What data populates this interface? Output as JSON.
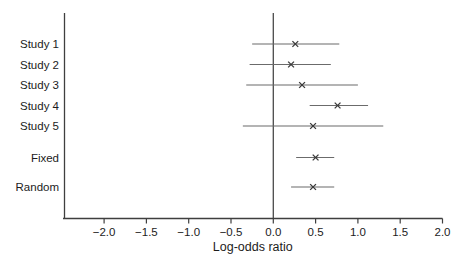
{
  "figure": {
    "title": "",
    "xlabel": "Log-odds ratio"
  },
  "chart_data": {
    "type": "scatter",
    "subtype": "forest-plot",
    "title": "",
    "xlabel": "Log-odds ratio",
    "ylabel": "",
    "xlim": [
      -2.47,
      2.0
    ],
    "grid": false,
    "legend": "none",
    "reference_line_x": 0.0,
    "marker_symbol": "x",
    "x_ticks": [
      {
        "value": -2.0,
        "label": "−2.0"
      },
      {
        "value": -1.5,
        "label": "−1.5"
      },
      {
        "value": -1.0,
        "label": "−1.0"
      },
      {
        "value": -0.5,
        "label": "−0.5"
      },
      {
        "value": 0.0,
        "label": "0.0"
      },
      {
        "value": 0.5,
        "label": "0.5"
      },
      {
        "value": 1.0,
        "label": "1.0"
      },
      {
        "value": 1.5,
        "label": "1.5"
      },
      {
        "value": 2.0,
        "label": "2.0"
      }
    ],
    "rows": [
      {
        "label": "Study 1",
        "group": "study",
        "estimate": 0.26,
        "ci_lower": -0.25,
        "ci_upper": 0.78
      },
      {
        "label": "Study 2",
        "group": "study",
        "estimate": 0.21,
        "ci_lower": -0.28,
        "ci_upper": 0.68
      },
      {
        "label": "Study 3",
        "group": "study",
        "estimate": 0.34,
        "ci_lower": -0.32,
        "ci_upper": 1.0
      },
      {
        "label": "Study 4",
        "group": "study",
        "estimate": 0.76,
        "ci_lower": 0.43,
        "ci_upper": 1.12
      },
      {
        "label": "Study 5",
        "group": "study",
        "estimate": 0.47,
        "ci_lower": -0.36,
        "ci_upper": 1.3
      },
      {
        "label": "Fixed",
        "group": "summary",
        "estimate": 0.5,
        "ci_lower": 0.27,
        "ci_upper": 0.72
      },
      {
        "label": "Random",
        "group": "summary",
        "estimate": 0.47,
        "ci_lower": 0.21,
        "ci_upper": 0.72
      }
    ],
    "colors": {
      "ci_line": "#6b6b6b",
      "axis": "#3f3f3f",
      "reference_line": "#4a4a4a",
      "marker": "#3a3a3a",
      "text": "#1c1c1c"
    }
  }
}
